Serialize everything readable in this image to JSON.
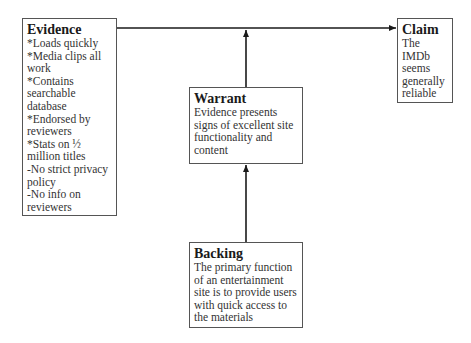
{
  "diagram": {
    "type": "Toulmin argument model",
    "evidence": {
      "title": "Evidence",
      "lines": [
        "*Loads quickly",
        "*Media clips all",
        "work",
        "*Contains",
        "searchable",
        "database",
        "*Endorsed by",
        "reviewers",
        "*Stats on ½",
        "million titles",
        "-No strict privacy",
        "policy",
        "-No info on",
        "reviewers"
      ]
    },
    "claim": {
      "title": "Claim",
      "lines": [
        "The",
        "IMDb",
        "seems",
        "generally",
        "reliable"
      ]
    },
    "warrant": {
      "title": "Warrant",
      "lines": [
        "Evidence presents",
        "signs of excellent site",
        "functionality and",
        "content"
      ]
    },
    "backing": {
      "title": "Backing",
      "lines": [
        "The primary function",
        "of an entertainment",
        "site is to provide users",
        "with quick access to",
        "the materials"
      ]
    },
    "connections": [
      {
        "from": "evidence",
        "to": "claim"
      },
      {
        "from": "warrant",
        "to": "evidence-claim-line"
      },
      {
        "from": "backing",
        "to": "warrant"
      }
    ]
  }
}
